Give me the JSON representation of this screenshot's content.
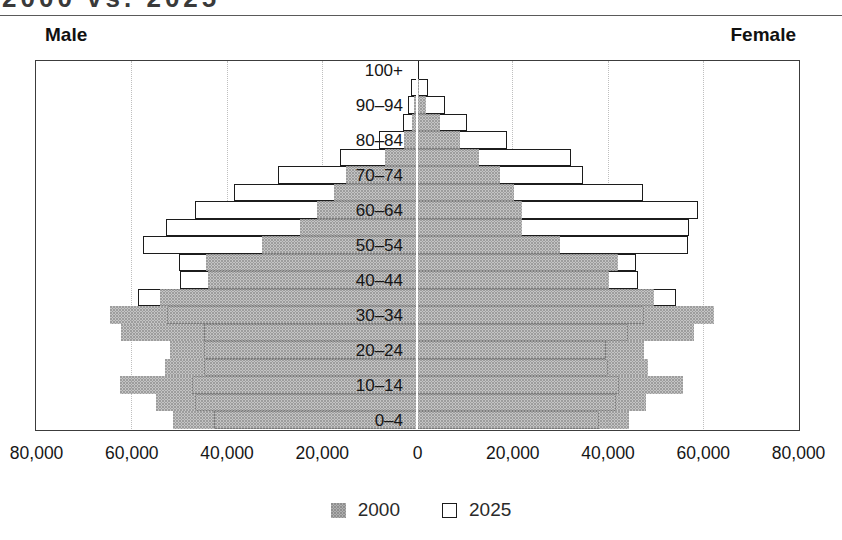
{
  "title_fragment": "2000 vs. 2025",
  "headers": {
    "male": "Male",
    "female": "Female"
  },
  "legend": [
    {
      "label": "2000",
      "style": "gray-filled"
    },
    {
      "label": "2025",
      "style": "white-outlined"
    }
  ],
  "colors": {
    "gray_fill": "#9d9d9d",
    "bar_outline": "#1c1c1c",
    "gridline": "#bfbfbf",
    "frame": "#3c3c3c",
    "text": "#161616"
  },
  "chart_data": {
    "type": "bar",
    "subtype": "population-pyramid",
    "left_side": "Male",
    "right_side": "Female",
    "xlim": [
      -80000,
      80000
    ],
    "x_tick_values": [
      -80000,
      -60000,
      -40000,
      -20000,
      0,
      20000,
      40000,
      60000,
      80000
    ],
    "x_tick_labels": [
      "80,000",
      "60,000",
      "40,000",
      "20,000",
      "0",
      "20,000",
      "40,000",
      "60,000",
      "80,000"
    ],
    "gridline_values": [
      -60000,
      -40000,
      -20000,
      20000,
      40000,
      60000
    ],
    "grid": "dotted-vertical",
    "legend_position": "bottom-center",
    "age_groups_top_to_bottom": [
      "100+",
      "95–99",
      "90–94",
      "85–89",
      "80–84",
      "75–79",
      "70–74",
      "65–69",
      "60–64",
      "55–59",
      "50–54",
      "45–49",
      "40–44",
      "35–39",
      "30–34",
      "25–29",
      "20–24",
      "15–19",
      "10–14",
      "5–9",
      "0–4"
    ],
    "labeled_rows": [
      0,
      2,
      4,
      6,
      8,
      10,
      12,
      14,
      16,
      18,
      20
    ],
    "series": [
      {
        "name": "2000",
        "style": "gray-filled",
        "male": [
          100,
          200,
          600,
          1000,
          2700,
          6700,
          15000,
          17500,
          21000,
          24500,
          32600,
          44200,
          43800,
          53900,
          64500,
          62200,
          51900,
          52900,
          62400,
          54700,
          51200
        ],
        "female": [
          100,
          500,
          1800,
          4800,
          9000,
          13000,
          17500,
          20300,
          22100,
          22100,
          30100,
          42100,
          40400,
          49800,
          62400,
          58200,
          47700,
          48400,
          55800,
          48100,
          44500
        ]
      },
      {
        "name": "2025",
        "style": "white-outlined",
        "male": [
          300,
          1200,
          1800,
          2900,
          7900,
          16100,
          29200,
          38500,
          46600,
          52600,
          57500,
          50000,
          49700,
          58500,
          52400,
          44800,
          44800,
          44800,
          47300,
          46700,
          42700
        ],
        "female": [
          500,
          2400,
          5900,
          10600,
          18900,
          32300,
          34900,
          47400,
          58900,
          57200,
          56800,
          45900,
          46300,
          54300,
          47700,
          44200,
          39600,
          40000,
          42400,
          41700,
          38200
        ]
      }
    ]
  }
}
